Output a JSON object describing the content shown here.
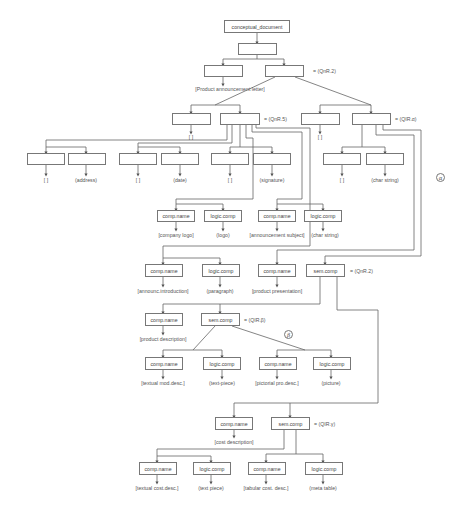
{
  "diagram": {
    "root": "conceptual_document",
    "box_labels": {
      "comp_name": "comp.name",
      "logic_comp": "logic.comp",
      "sem_comp": "sem.comp"
    },
    "relations": {
      "r1": "=  (QnR.2)",
      "r2": "=  (QnR.5)",
      "r3": "=  (QIR.α)",
      "r4": "=  (QnR.2)",
      "r5": "=  (QIR.β)",
      "r6": "=  (QIR.γ)"
    },
    "markers": {
      "alpha": "α",
      "beta": "β"
    },
    "labels": {
      "product_announcement_letter": "[Product announcement letter]",
      "empty1": "[  ]",
      "empty2": "[  ]",
      "l3_1": "[  ]",
      "l3_2": "(address)",
      "l3_3": "[  ]",
      "l3_4": "(date)",
      "l3_5": "[  ]",
      "l3_6": "(signature)",
      "l3_7": "[  ]",
      "l3_8": "(char string)",
      "l4_1": "[company logo]",
      "l4_2": "(logo)",
      "l4_3": "[announcement subject]",
      "l4_4": "(char string)",
      "l5_1": "[announc.introduction]",
      "l5_2": "(paragraph)",
      "l5_3": "[product presentation]",
      "l6_1": "[product description]",
      "l7_1": "[textual mod.desc.]",
      "l7_2": "(text-piece)",
      "l7_3": "[pictorial pro.desc.]",
      "l7_4": "(picture)",
      "l8_1": "[cost description]",
      "l9_1": "[textual cost.desc.]",
      "l9_2": "(text piece)",
      "l9_3": "[tabular cost. desc.]",
      "l9_4": "(meta table)"
    }
  }
}
